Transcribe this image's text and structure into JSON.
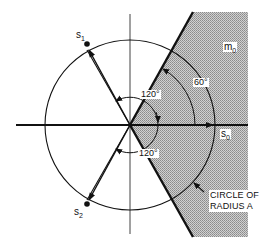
{
  "diagram": {
    "labels": {
      "s1": {
        "base": "s",
        "sub": "1"
      },
      "s2": {
        "base": "s",
        "sub": "2"
      },
      "s0": {
        "base": "s",
        "sub": "0"
      },
      "m0": {
        "base": "m",
        "sub": "0"
      },
      "angle_upper": "120°",
      "angle_lower": "120°",
      "angle_region": "60°",
      "circle_note_line1": "CIRCLE OF",
      "circle_note_line2": "RADIUS A"
    },
    "colors": {
      "line": "#111111",
      "shade": "#b5b5b5",
      "background": "#ffffff"
    }
  }
}
